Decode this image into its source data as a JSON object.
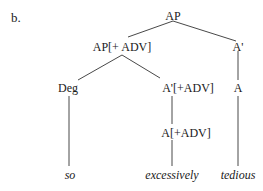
{
  "marker": "b.",
  "nodes": {
    "root": "AP",
    "ap_adv": "AP[+ ADV]",
    "a_bar": "A'",
    "deg": "Deg",
    "a_bar_adv": "A'[+ADV]",
    "a": "A",
    "a_adv": "A[+ADV]"
  },
  "leaves": {
    "so": "so",
    "excessively": "excessively",
    "tedious": "tedious"
  },
  "colors": {
    "line": "#333333",
    "text": "#1a1a1a"
  }
}
